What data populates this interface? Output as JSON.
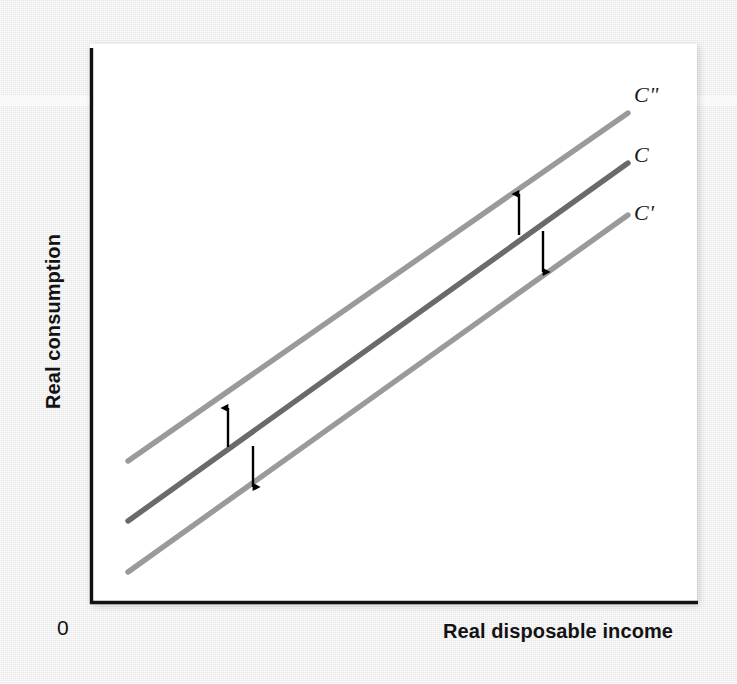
{
  "figure": {
    "origin_label": "0",
    "background_color": "#ededed",
    "panel_color": "#ffffff"
  },
  "chart_data": {
    "type": "line",
    "title": "",
    "subtitle": "",
    "xlabel": "Real disposable income",
    "ylabel": "Real consumption",
    "xlim": [
      0,
      100
    ],
    "ylim": [
      0,
      100
    ],
    "grid": false,
    "axis_ticks": false,
    "legend_position": "right-of-line-ends",
    "origin_label": "0",
    "series": [
      {
        "name": "C″",
        "label": "C\"",
        "color": "#9a9a9a",
        "linewidth": 5,
        "description": "Upward-shifted consumption function (autonomous consumption higher)",
        "x": [
          7.5,
          89.0
        ],
        "y": [
          30.5,
          88.5
        ],
        "pixel_start": [
          128,
          461
        ],
        "pixel_end": [
          628,
          113
        ]
      },
      {
        "name": "C",
        "label": "C",
        "color": "#6a6a6a",
        "linewidth": 5,
        "description": "Baseline consumption function",
        "x": [
          7.5,
          89.0
        ],
        "y": [
          18.0,
          77.0
        ],
        "pixel_start": [
          128,
          521
        ],
        "pixel_end": [
          628,
          163
        ]
      },
      {
        "name": "C′",
        "label": "C'",
        "color": "#9a9a9a",
        "linewidth": 5,
        "description": "Downward-shifted consumption function (autonomous consumption lower)",
        "x": [
          7.5,
          89.0
        ],
        "y": [
          8.0,
          67.0
        ],
        "pixel_start": [
          128,
          572
        ],
        "pixel_end": [
          628,
          215
        ]
      }
    ],
    "annotations": [
      {
        "name": "shift-up-arrow-left",
        "direction": "up",
        "meaning": "Upward shift from C to C″",
        "x": 25,
        "from_y": 37,
        "to_y": 48
      },
      {
        "name": "shift-down-arrow-left",
        "direction": "down",
        "meaning": "Downward shift from C to C′",
        "x": 30,
        "from_y": 36,
        "to_y": 26
      },
      {
        "name": "shift-up-arrow-right",
        "direction": "up",
        "meaning": "Upward shift from C to C″",
        "x": 70,
        "from_y": 64,
        "to_y": 76
      },
      {
        "name": "shift-down-arrow-right",
        "direction": "down",
        "meaning": "Downward shift from C to C′",
        "x": 74,
        "from_y": 68,
        "to_y": 57
      }
    ]
  },
  "labels": {
    "curve_top": "C\"",
    "curve_middle": "C",
    "curve_bottom": "C'",
    "x_axis": "Real disposable income",
    "y_axis": "Real consumption",
    "origin": "0"
  },
  "colors": {
    "axis": "#111111",
    "line_shifted": "#9a9a9a",
    "line_base": "#6a6a6a",
    "arrow": "#000000",
    "text": "#131313",
    "background": "#ededed",
    "panel": "#ffffff"
  }
}
